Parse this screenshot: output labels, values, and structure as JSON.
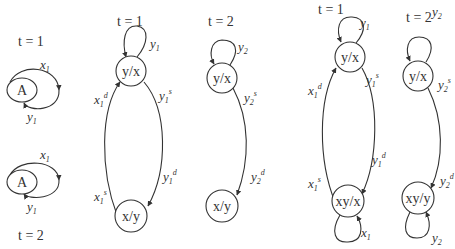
{
  "diagram": {
    "panel_a": {
      "top": {
        "time": "t = 1",
        "node": "A",
        "edge_top": "x",
        "edge_top_sub": "1",
        "edge_bottom": "y",
        "edge_bottom_sub": "1"
      },
      "bottom": {
        "time": "t = 2",
        "node": "A",
        "edge_top": "x",
        "edge_top_sub": "1",
        "edge_bottom": "y",
        "edge_bottom_sub": "1"
      }
    },
    "panel_b": {
      "time": "t = 1",
      "node_top": "y/x",
      "node_bottom": "x/y",
      "loop": {
        "base": "y",
        "sub": "1"
      },
      "left_upper": {
        "base": "x",
        "sub": "1",
        "sup": "d"
      },
      "left_lower": {
        "base": "x",
        "sub": "1",
        "sup": "s"
      },
      "right_upper": {
        "base": "y",
        "sub": "1",
        "sup": "s"
      },
      "right_lower": {
        "base": "y",
        "sub": "1",
        "sup": "d"
      }
    },
    "panel_c": {
      "time": "t = 2",
      "node_top": "y/x",
      "node_bottom": "x/y",
      "loop": {
        "base": "y",
        "sub": "2"
      },
      "right_upper": {
        "base": "y",
        "sub": "2",
        "sup": "s"
      },
      "right_lower": {
        "base": "y",
        "sub": "2",
        "sup": "d"
      }
    },
    "panel_d": {
      "time": "t = 1",
      "node_top": "y/x",
      "node_bottom": "xy/x",
      "loop_top": {
        "base": "y",
        "sub": "1"
      },
      "loop_bottom": {
        "base": "x",
        "sub": "1"
      },
      "left_upper": {
        "base": "x",
        "sub": "1",
        "sup": "d"
      },
      "left_lower": {
        "base": "x",
        "sub": "1",
        "sup": "s"
      },
      "right_upper": {
        "base": "y",
        "sub": "1",
        "sup": "s"
      },
      "right_lower": {
        "base": "y",
        "sub": "1",
        "sup": "d"
      }
    },
    "panel_e": {
      "time": "t = 2",
      "node_top": "y/x",
      "node_bottom": "xy/y",
      "loop_top": {
        "base": "y",
        "sub": "2"
      },
      "loop_bottom": {
        "base": "y",
        "sub": "2"
      },
      "right_upper": {
        "base": "y",
        "sub": "2",
        "sup": "s"
      },
      "right_lower": {
        "base": "y",
        "sub": "2",
        "sup": "d"
      }
    }
  }
}
